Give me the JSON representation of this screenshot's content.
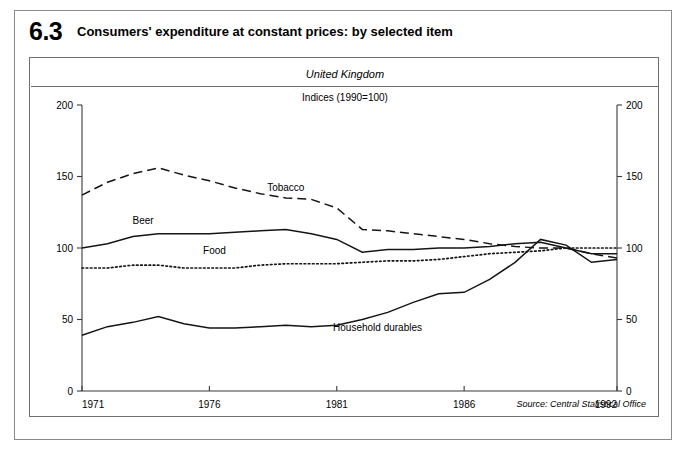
{
  "figure": {
    "number": "6.3",
    "title": "Consumers' expenditure at constant prices: by selected item",
    "region": "United Kingdom",
    "units": "Indices (1990=100)",
    "source": "Source: Central Statistical Office"
  },
  "chart_data": {
    "type": "line",
    "title": "Consumers' expenditure at constant prices: by selected item",
    "subtitle": "Indices (1990=100)",
    "xlabel": "",
    "ylabel": "",
    "xlim": [
      1971,
      1992
    ],
    "ylim": [
      0,
      200
    ],
    "grid": false,
    "legend": "inline-labels",
    "xticks": [
      "1971",
      "1976",
      "1981",
      "1986",
      "1992"
    ],
    "xtick_values": [
      1971,
      1976,
      1981,
      1986,
      1992
    ],
    "yticks": [
      "0",
      "50",
      "100",
      "150",
      "200"
    ],
    "ytick_values": [
      0,
      50,
      100,
      150,
      200
    ],
    "dual_y_axis": true,
    "x": [
      1971,
      1972,
      1973,
      1974,
      1975,
      1976,
      1977,
      1978,
      1979,
      1980,
      1981,
      1982,
      1983,
      1984,
      1985,
      1986,
      1987,
      1988,
      1989,
      1990,
      1991,
      1992
    ],
    "series": [
      {
        "name": "Tobacco",
        "style": "dashed",
        "values": [
          137,
          146,
          152,
          156,
          151,
          147,
          142,
          138,
          135,
          134,
          128,
          113,
          112,
          110,
          108,
          106,
          103,
          101,
          100,
          100,
          96,
          93
        ]
      },
      {
        "name": "Beer",
        "style": "solid",
        "values": [
          100,
          103,
          108,
          110,
          110,
          110,
          111,
          112,
          113,
          110,
          106,
          97,
          99,
          99,
          100,
          100,
          101,
          103,
          104,
          100,
          96,
          96
        ]
      },
      {
        "name": "Food",
        "style": "dotted",
        "values": [
          86,
          86,
          88,
          88,
          86,
          86,
          86,
          88,
          89,
          89,
          89,
          90,
          91,
          91,
          92,
          94,
          96,
          97,
          98,
          100,
          100,
          100
        ]
      },
      {
        "name": "Household durables",
        "style": "solid",
        "values": [
          39,
          45,
          48,
          52,
          47,
          44,
          44,
          45,
          46,
          45,
          46,
          50,
          55,
          62,
          68,
          69,
          78,
          90,
          106,
          102,
          90,
          92
        ]
      }
    ],
    "annotations": [
      {
        "text": "Tobacco",
        "x": 1979,
        "y": 140
      },
      {
        "text": "Beer",
        "x": 1973.4,
        "y": 117
      },
      {
        "text": "Food",
        "x": 1976.2,
        "y": 96
      },
      {
        "text": "Household durables",
        "x": 1982.6,
        "y": 42
      }
    ]
  }
}
